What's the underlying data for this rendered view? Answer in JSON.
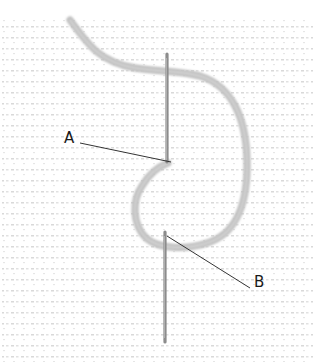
{
  "diagram": {
    "type": "needle-stitch-illustration",
    "labels": [
      {
        "id": "A",
        "text": "A",
        "x": 64,
        "y": 131,
        "pointer_from": [
          80,
          143
        ],
        "pointer_to": [
          171,
          162
        ]
      },
      {
        "id": "B",
        "text": "B",
        "x": 254,
        "y": 275,
        "pointer_from": [
          250,
          288
        ],
        "pointer_to": [
          167,
          236
        ]
      }
    ],
    "colors": {
      "background": "#ffffff",
      "fabric_dots": "#c8c8c8",
      "thread": "#b5b5b5",
      "thread_shadow": "#a0a0a0",
      "needle": "#8a8a8a",
      "leader_line": "#333333",
      "label_text": "#1a1a1a"
    }
  }
}
